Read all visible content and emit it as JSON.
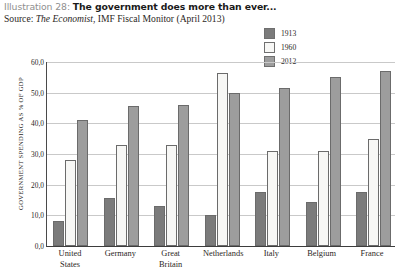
{
  "header": {
    "illustration_prefix": "Illustration 28:",
    "title": "The government does more than ever...",
    "source_prefix": "Source: ",
    "source_italic": "The Economist",
    "source_rest": ", IMF Fiscal Monitor (April 2013)"
  },
  "chart_data": {
    "type": "bar",
    "title": "The government does more than ever...",
    "xlabel": "",
    "ylabel": "GOVERNMENT SPENDING AS % OF GDP",
    "ylim": [
      0,
      60
    ],
    "ytick_labels": [
      "0,0",
      "10,0",
      "20,0",
      "30,0",
      "40,0",
      "50,0",
      "60,0"
    ],
    "ytick_values": [
      0,
      10,
      20,
      30,
      40,
      50,
      60
    ],
    "grid": true,
    "legend_position": "top-right",
    "categories": [
      "United States",
      "Germany",
      "Great Britain",
      "Netherlands",
      "Italy",
      "Belgium",
      "France"
    ],
    "category_lines": [
      [
        "United",
        "States"
      ],
      [
        "Germany",
        ""
      ],
      [
        "Great",
        "Britain"
      ],
      [
        "Netherlands",
        ""
      ],
      [
        "Italy",
        ""
      ],
      [
        "Belgium",
        ""
      ],
      [
        "France",
        ""
      ]
    ],
    "series": [
      {
        "name": "1913",
        "color": "#7b7b7b",
        "values": [
          8.0,
          15.5,
          13.0,
          10.0,
          17.5,
          14.5,
          17.5
        ]
      },
      {
        "name": "1960",
        "color": "#f7f7f5",
        "values": [
          28.0,
          33.0,
          33.0,
          56.5,
          31.0,
          31.0,
          35.0
        ]
      },
      {
        "name": "2012",
        "color": "#9d9d9d",
        "values": [
          41.0,
          45.5,
          46.0,
          50.0,
          51.5,
          55.0,
          57.0
        ]
      }
    ]
  },
  "colors": {
    "series_1913": "#7b7b7b",
    "series_1960": "#f7f7f5",
    "series_2012": "#9d9d9d",
    "axis": "#3d3d3d",
    "grid": "#c9c9c9",
    "title_accent": "#8f8f8f"
  }
}
